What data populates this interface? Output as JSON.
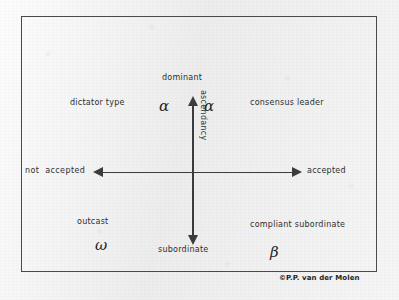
{
  "figure": {
    "copyright": "©P.P. van der Molen",
    "axes": {
      "vertical": {
        "name": "ascendancy",
        "top_label": "dominant",
        "bottom_label": "subordinate"
      },
      "horizontal": {
        "name": "acceptance",
        "left_label": "not  accepted",
        "right_label": "accepted"
      }
    },
    "quadrants": {
      "top_left": {
        "label": "dictator\ntype",
        "symbol": "α"
      },
      "top_right": {
        "label": "consensus\nleader",
        "symbol": "α"
      },
      "bottom_left": {
        "label": "outcast",
        "symbol": "ω"
      },
      "bottom_right": {
        "label": "compliant\nsubordinate",
        "symbol": "β"
      }
    }
  },
  "chart_data": {
    "type": "scatter",
    "title": "",
    "xlabel": "",
    "ylabel": "ascendancy",
    "grid": false,
    "legend": "none",
    "axis_style": "double-headed arrows crossing at origin",
    "x_axis": {
      "label_left": "not  accepted",
      "label_right": "accepted",
      "range": [
        "not accepted",
        "accepted"
      ]
    },
    "y_axis": {
      "label": "ascendancy",
      "label_top": "dominant",
      "label_bottom": "subordinate",
      "range": [
        "subordinate",
        "dominant"
      ]
    },
    "annotations": [
      {
        "text": "dictator type",
        "symbol": "α",
        "quadrant": "top-left",
        "x": -0.6,
        "y": 0.55
      },
      {
        "text": "consensus leader",
        "symbol": "α",
        "quadrant": "top-right",
        "x": 0.6,
        "y": 0.55
      },
      {
        "text": "outcast",
        "symbol": "ω",
        "quadrant": "bottom-left",
        "x": -0.6,
        "y": -0.55
      },
      {
        "text": "compliant subordinate",
        "symbol": "β",
        "quadrant": "bottom-right",
        "x": 0.6,
        "y": -0.55
      }
    ]
  }
}
